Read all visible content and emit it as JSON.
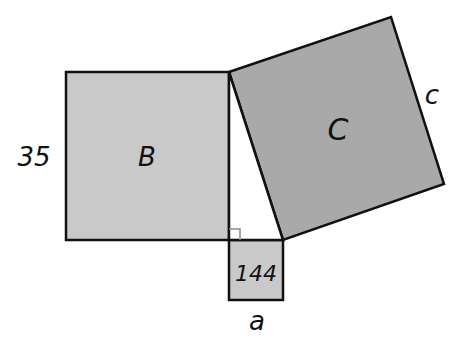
{
  "diagram": {
    "type": "pythagorean-squares",
    "colors": {
      "background": "#ffffff",
      "square_b_fill": "#c9c9c9",
      "square_c_fill": "#a9a9a9",
      "square_a_fill": "#c9c9c9",
      "stroke": "#111111",
      "right_angle_marker": "#888888"
    },
    "square_b": {
      "label": "B",
      "side_label": "35"
    },
    "square_c": {
      "label": "C",
      "side_label": "c"
    },
    "square_a": {
      "label": "144",
      "side_label": "a"
    },
    "triangle": {
      "right_angle": true
    }
  }
}
